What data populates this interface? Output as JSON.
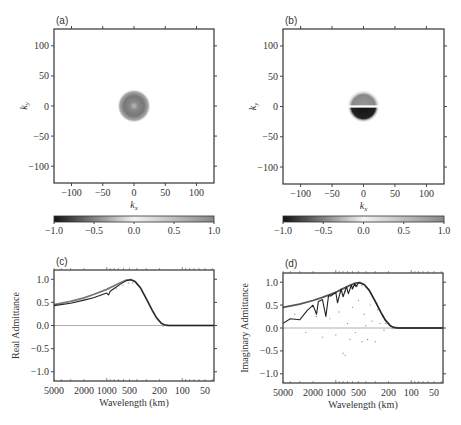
{
  "figure": {
    "panels": [
      {
        "id": "a",
        "label": "(a)"
      },
      {
        "id": "b",
        "label": "(b)"
      },
      {
        "id": "c",
        "label": "(c)"
      },
      {
        "id": "d",
        "label": "(d)"
      }
    ]
  },
  "chart_data": [
    {
      "type": "heatmap",
      "panel_label": "(a)",
      "xlabel": "k_x",
      "ylabel": "k_y",
      "xlim": [
        -128,
        128
      ],
      "ylim": [
        -128,
        128
      ],
      "xticks": [
        -100,
        -50,
        0,
        50,
        100
      ],
      "yticks": [
        -100,
        -50,
        0,
        50,
        100
      ],
      "description": "Radially symmetric ring centered at origin, radius ~20, mid-gray values (~ -0.3), lighter center",
      "pattern": "ring",
      "ring_radius": 20,
      "value": -0.3,
      "colorbar": {
        "min": -1.0,
        "max": 1.0,
        "ticks": [
          "-1.0",
          "-0.5",
          "0.0",
          "0.5",
          "1.0"
        ]
      }
    },
    {
      "type": "heatmap",
      "panel_label": "(b)",
      "xlabel": "k_x",
      "ylabel": "k_y",
      "xlim": [
        -128,
        128
      ],
      "ylim": [
        -128,
        128
      ],
      "xticks": [
        -100,
        -50,
        0,
        50,
        100
      ],
      "yticks": [
        -100,
        -50,
        0,
        50,
        100
      ],
      "description": "Antisymmetric disk: upper half mid-gray (~ -0.3), lower half dark (~ -1.0), radius ~20",
      "pattern": "split-disk",
      "ring_radius": 20,
      "upper_value": -0.3,
      "lower_value": -1.0,
      "colorbar": {
        "min": -1.0,
        "max": 1.0,
        "ticks": [
          "-1.0",
          "-0.5",
          "0.0",
          "0.5",
          "1.0"
        ]
      }
    },
    {
      "type": "line",
      "panel_label": "(c)",
      "xlabel": "Wavelength (km)",
      "ylabel": "Real Admittance",
      "xscale": "log-reversed",
      "xlim": [
        5000,
        38
      ],
      "ylim": [
        -1.2,
        1.2
      ],
      "xticks": [
        5000,
        2000,
        1000,
        500,
        200,
        100,
        50
      ],
      "yticks": [
        "1.0",
        "0.5",
        "0.0",
        "-0.5",
        "-1.0"
      ],
      "series": [
        {
          "name": "theoretical",
          "color": "#777777",
          "x": [
            5000,
            3000,
            2000,
            1500,
            1000,
            800,
            650,
            550,
            480,
            420,
            360,
            300,
            250,
            220,
            190,
            170,
            150,
            100,
            50,
            38
          ],
          "y": [
            0.45,
            0.52,
            0.6,
            0.67,
            0.78,
            0.86,
            0.93,
            0.98,
            0.99,
            0.95,
            0.82,
            0.58,
            0.33,
            0.17,
            0.05,
            0.01,
            0.0,
            0.0,
            0.0,
            0.0
          ]
        },
        {
          "name": "recovered",
          "color": "#222222",
          "x": [
            5000,
            3000,
            2000,
            1500,
            1000,
            950,
            900,
            800,
            650,
            550,
            480,
            420,
            360,
            300,
            250,
            220,
            190,
            170,
            150,
            100,
            50,
            38
          ],
          "y": [
            0.43,
            0.48,
            0.55,
            0.6,
            0.7,
            0.66,
            0.74,
            0.8,
            0.9,
            0.97,
            0.99,
            0.95,
            0.82,
            0.58,
            0.33,
            0.17,
            0.05,
            0.01,
            0.0,
            0.0,
            0.0,
            0.0
          ]
        }
      ],
      "zero_line": true
    },
    {
      "type": "line",
      "panel_label": "(d)",
      "xlabel": "Wavelength (km)",
      "ylabel": "Imaginary Admittance",
      "xscale": "log-reversed",
      "xlim": [
        5000,
        38
      ],
      "ylim": [
        -1.2,
        1.2
      ],
      "xticks": [
        5000,
        2000,
        1000,
        500,
        200,
        100,
        50
      ],
      "yticks": [
        "1.0",
        "0.5",
        "0.0",
        "-0.5",
        "-1.0"
      ],
      "series": [
        {
          "name": "theoretical",
          "color": "#555555",
          "x": [
            5000,
            3000,
            2000,
            1500,
            1000,
            800,
            650,
            550,
            480,
            420,
            360,
            300,
            250,
            220,
            190,
            170,
            150,
            100,
            50,
            38
          ],
          "y": [
            0.45,
            0.52,
            0.6,
            0.67,
            0.78,
            0.86,
            0.93,
            0.98,
            0.99,
            0.95,
            0.82,
            0.58,
            0.33,
            0.17,
            0.05,
            0.01,
            0.0,
            0.0,
            0.0,
            0.0
          ]
        },
        {
          "name": "recovered",
          "color": "#222222",
          "x": [
            5000,
            4000,
            3000,
            2400,
            2000,
            1800,
            1700,
            1500,
            1350,
            1250,
            1150,
            1000,
            950,
            850,
            800,
            720,
            680,
            620,
            600,
            560,
            540,
            500,
            480,
            420,
            360,
            300,
            250,
            220,
            190,
            170,
            150,
            100,
            50,
            38
          ],
          "y": [
            0.1,
            0.2,
            0.18,
            0.38,
            0.5,
            0.3,
            0.58,
            0.62,
            0.25,
            0.7,
            0.7,
            0.78,
            0.55,
            0.85,
            0.68,
            0.9,
            0.75,
            0.94,
            0.85,
            0.97,
            0.9,
            0.99,
            0.98,
            0.95,
            0.82,
            0.58,
            0.33,
            0.17,
            0.05,
            0.01,
            0.0,
            0.0,
            0.0,
            0.0
          ]
        }
      ],
      "scatter_points": {
        "x": [
          3500,
          2500,
          1800,
          1500,
          1200,
          1000,
          900,
          800,
          750,
          700,
          650,
          600,
          550,
          500,
          450,
          420,
          400,
          380,
          350,
          330,
          300,
          280,
          260,
          240,
          230,
          220
        ],
        "y": [
          0.3,
          -0.1,
          0.25,
          -0.2,
          0.2,
          -0.15,
          0.35,
          -0.55,
          -0.6,
          0.1,
          -0.25,
          0.45,
          -0.1,
          0.6,
          -0.3,
          0.3,
          0.05,
          -0.25,
          0.5,
          0.15,
          -0.3,
          0.4,
          0.1,
          0.25,
          -0.05,
          0.1
        ]
      },
      "zero_line": true
    }
  ]
}
